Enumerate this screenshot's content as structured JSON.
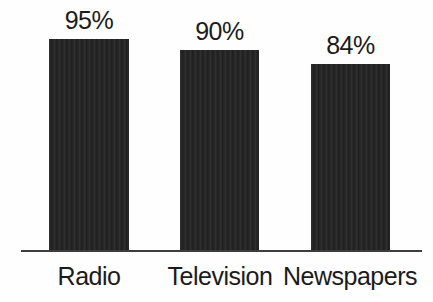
{
  "chart_data": {
    "type": "bar",
    "categories": [
      "Radio",
      "Television",
      "Newspapers"
    ],
    "values": [
      95,
      90,
      84
    ],
    "value_labels": [
      "95%",
      "90%",
      "84%"
    ],
    "title": "",
    "xlabel": "",
    "ylabel": "",
    "ylim": [
      0,
      100
    ],
    "grid": false,
    "legend": "none",
    "plot_height_px": 224,
    "bar_color": "#242424",
    "axis_line_color": "#3d3d3d",
    "text_color": "#1b1b1b",
    "background_color": "#fefefe"
  }
}
